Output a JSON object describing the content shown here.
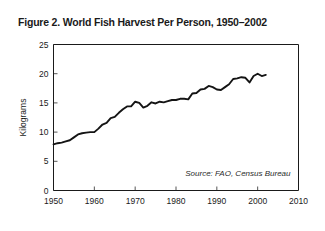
{
  "figure": {
    "title": "Figure 2. World Fish Harvest Per Person, 1950–2002",
    "source_note": "Source: FAO, Census Bureau",
    "background_color": "#ffffff",
    "line_color": "#141414",
    "axis_color": "#1a1a1a"
  },
  "chart_data": {
    "type": "line",
    "title": "Figure 2. World Fish Harvest Per Person, 1950–2002",
    "xlabel": "",
    "ylabel": "Kilograms",
    "xlim": [
      1950,
      2010
    ],
    "ylim": [
      0,
      25
    ],
    "xticks": [
      1950,
      1960,
      1970,
      1980,
      1990,
      2000,
      2010
    ],
    "yticks": [
      0,
      5,
      10,
      15,
      20,
      25
    ],
    "xtick_labels": [
      "1950",
      "1960",
      "1970",
      "1980",
      "1990",
      "2000",
      "2010"
    ],
    "ytick_labels": [
      "0",
      "5",
      "10",
      "15",
      "20",
      "25"
    ],
    "grid": false,
    "legend": false,
    "annotations": [
      "Source: FAO, Census Bureau"
    ],
    "series": [
      {
        "name": "World fish harvest per person",
        "units": "kilograms",
        "x": [
          1950,
          1951,
          1952,
          1953,
          1954,
          1955,
          1956,
          1957,
          1958,
          1959,
          1960,
          1961,
          1962,
          1963,
          1964,
          1965,
          1966,
          1967,
          1968,
          1969,
          1970,
          1971,
          1972,
          1973,
          1974,
          1975,
          1976,
          1977,
          1978,
          1979,
          1980,
          1981,
          1982,
          1983,
          1984,
          1985,
          1986,
          1987,
          1988,
          1989,
          1990,
          1991,
          1992,
          1993,
          1994,
          1995,
          1996,
          1997,
          1998,
          1999,
          2000,
          2001,
          2002
        ],
        "values": [
          7.9,
          8.1,
          8.2,
          8.4,
          8.6,
          9.1,
          9.6,
          9.8,
          9.9,
          10.0,
          10.0,
          10.6,
          11.3,
          11.6,
          12.4,
          12.6,
          13.3,
          13.9,
          14.4,
          14.4,
          15.2,
          15.0,
          14.2,
          14.5,
          15.1,
          14.9,
          15.2,
          15.1,
          15.3,
          15.5,
          15.5,
          15.7,
          15.7,
          15.6,
          16.6,
          16.7,
          17.3,
          17.4,
          17.9,
          17.7,
          17.3,
          17.2,
          17.7,
          18.2,
          19.1,
          19.2,
          19.4,
          19.3,
          18.5,
          19.6,
          20.0,
          19.6,
          19.8
        ]
      }
    ]
  }
}
